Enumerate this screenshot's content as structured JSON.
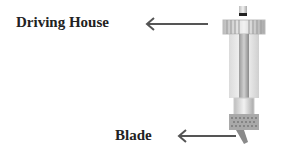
{
  "diagram": {
    "labels": [
      {
        "id": "driving-house",
        "text": "Driving House"
      },
      {
        "id": "blade",
        "text": "Blade"
      }
    ],
    "arrows": [
      {
        "from": "tool-top",
        "to": "driving-house",
        "direction": "left"
      },
      {
        "from": "tool-tip",
        "to": "blade",
        "direction": "left"
      }
    ],
    "illustration": "blade-holder-tool"
  }
}
